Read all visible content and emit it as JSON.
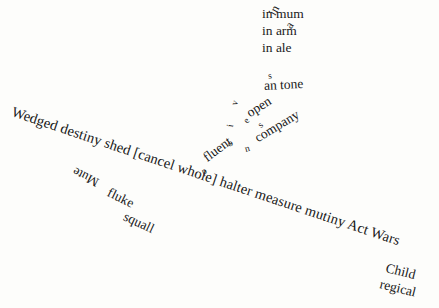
{
  "canvas": {
    "width": 439,
    "height": 308,
    "background_color": "#fdfdfb",
    "ink_color": "#181818"
  },
  "top_stack": {
    "line_1": "in mum",
    "line_2": "in arm",
    "line_3": "in ale",
    "overlap_fragment_1": "in",
    "overlap_fragment_2": "a"
  },
  "cluster": {
    "s_mark": "s",
    "an_tone": "an tone",
    "open": "open",
    "company": "company",
    "fluent": "fluent",
    "scattered_letters": {
      "v": "v",
      "i": "i",
      "e": "e",
      "s": "s",
      "o": "o",
      "n": "n",
      "p": "p"
    }
  },
  "main_line": {
    "text": "Wedged destiny shed [cancel whole] halter measure mutiny Act Wars"
  },
  "lower_left": {
    "mute": "Mute",
    "fluke": "fluke",
    "squall": "squall"
  },
  "bottom_right": {
    "child": "Child",
    "regical": "regical"
  }
}
